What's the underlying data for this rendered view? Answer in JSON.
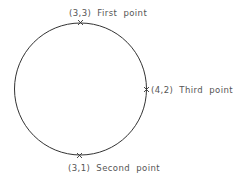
{
  "diagram": {
    "type": "three-point-circle",
    "circle": {
      "cx": 80.5,
      "cy": 89,
      "r": 66,
      "stroke": "#333333"
    },
    "points": [
      {
        "coord": "(3,3)",
        "label": "First point",
        "text": "(3,3)  First  point",
        "marker": "x-mark-icon"
      },
      {
        "coord": "(3,1)",
        "label": "Second point",
        "text": "(3,1)  Second  point",
        "marker": "x-mark-icon"
      },
      {
        "coord": "(4,2)",
        "label": "Third point",
        "text": "(4,2)  Third  point",
        "marker": "x-mark-icon"
      }
    ]
  }
}
